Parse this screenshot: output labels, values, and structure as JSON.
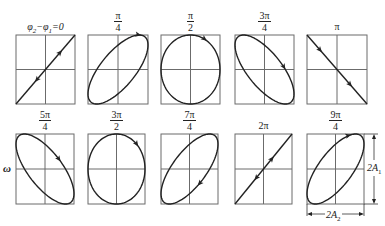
{
  "figure": {
    "left_label": "ω",
    "panels": [
      {
        "id": 0,
        "label_type": "text",
        "label": "φ2−φ1=0",
        "num": "",
        "den": "",
        "box": [
          16,
          35,
          59,
          69
        ],
        "shape": "line",
        "slope": "pos",
        "arrows": "both_along"
      },
      {
        "id": 1,
        "label_type": "frac",
        "label": "π/4",
        "num": "π",
        "den": "4",
        "box": [
          88,
          35,
          60,
          69
        ],
        "shape": "ellipse",
        "tilt": "pos",
        "phase_deg": 45
      },
      {
        "id": 2,
        "label_type": "frac",
        "label": "π/2",
        "num": "π",
        "den": "2",
        "box": [
          161,
          35,
          59,
          69
        ],
        "shape": "ellipse",
        "tilt": "none",
        "phase_deg": 90
      },
      {
        "id": 3,
        "label_type": "frac",
        "label": "3π/4",
        "num": "3π",
        "den": "4",
        "box": [
          235,
          35,
          59,
          69
        ],
        "shape": "ellipse",
        "tilt": "neg",
        "phase_deg": 135
      },
      {
        "id": 4,
        "label_type": "text",
        "label": "π",
        "num": "",
        "den": "",
        "box": [
          307,
          35,
          60,
          69
        ],
        "shape": "line",
        "slope": "neg"
      },
      {
        "id": 5,
        "label_type": "frac",
        "label": "5π/4",
        "num": "5π",
        "den": "4",
        "box": [
          16,
          134,
          58,
          70
        ],
        "shape": "ellipse",
        "tilt": "neg",
        "phase_deg": 225
      },
      {
        "id": 6,
        "label_type": "frac",
        "label": "3π/2",
        "num": "3π",
        "den": "2",
        "box": [
          88,
          134,
          57,
          70
        ],
        "shape": "ellipse",
        "tilt": "none",
        "phase_deg": 270
      },
      {
        "id": 7,
        "label_type": "frac",
        "label": "7π/4",
        "num": "7π",
        "den": "4",
        "box": [
          161,
          134,
          57,
          70
        ],
        "shape": "ellipse",
        "tilt": "pos",
        "phase_deg": 315
      },
      {
        "id": 8,
        "label_type": "text",
        "label": "2π",
        "num": "",
        "den": "",
        "box": [
          235,
          134,
          57,
          70
        ],
        "shape": "line",
        "slope": "pos"
      },
      {
        "id": 9,
        "label_type": "frac",
        "label": "9π/4",
        "num": "9π",
        "den": "4",
        "box": [
          307,
          134,
          57,
          70
        ],
        "shape": "ellipse",
        "tilt": "pos",
        "phase_deg": 405
      }
    ],
    "dimensions": {
      "vertical_label": "2A",
      "vertical_sub": "1",
      "horizontal_label": "2A",
      "horizontal_sub": "2"
    },
    "colors": {
      "frame": "#6b6b6b",
      "curve": "#222222",
      "background": "#ffffff"
    }
  }
}
